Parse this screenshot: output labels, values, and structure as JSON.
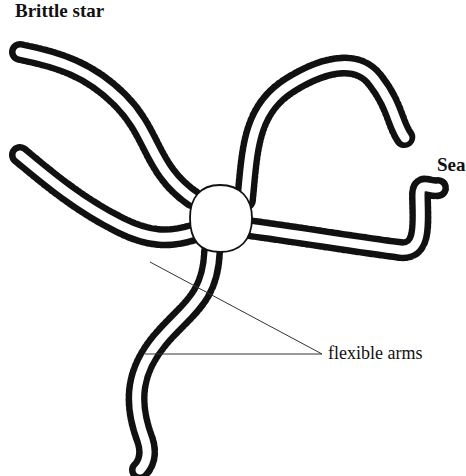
{
  "diagram": {
    "title": "Brittle star",
    "cutoff_label": "Sea",
    "annotation": "flexible arms",
    "colors": {
      "ink": "#111111",
      "background": "#ffffff"
    }
  }
}
